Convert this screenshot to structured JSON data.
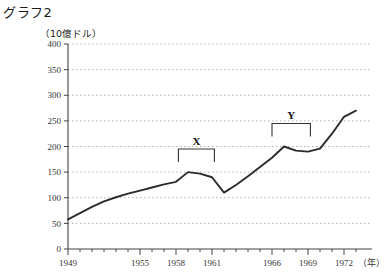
{
  "chart_title": "グラフ2",
  "unit_label": "（10億ドル）",
  "x_unit_label": "（年）",
  "annotations": {
    "x_bracket_label": "X",
    "y_bracket_label": "Y"
  },
  "colors": {
    "line": "#2b2b2b",
    "grid": "#b0b0b0",
    "axis": "#444444",
    "text": "#1a1a1a",
    "background": "#ffffff"
  },
  "chart_data": {
    "type": "line",
    "title": "グラフ2",
    "xlabel": "（年）",
    "ylabel": "（10億ドル）",
    "xlim": [
      1949,
      1973
    ],
    "ylim": [
      0,
      400
    ],
    "y_ticks": [
      0,
      50,
      100,
      150,
      200,
      250,
      300,
      350,
      400
    ],
    "x_ticks": [
      1949,
      1955,
      1958,
      1961,
      1966,
      1969,
      1972
    ],
    "x_tick_labels": [
      "1949",
      "1955",
      "1958",
      "1961",
      "1966",
      "1969",
      "1972"
    ],
    "grid": true,
    "grid_axis": "y",
    "legend": false,
    "series": [
      {
        "name": "value",
        "x": [
          1949,
          1950,
          1951,
          1952,
          1953,
          1954,
          1955,
          1956,
          1957,
          1958,
          1959,
          1960,
          1961,
          1962,
          1963,
          1964,
          1965,
          1966,
          1967,
          1968,
          1969,
          1970,
          1971,
          1972,
          1973
        ],
        "values": [
          58,
          70,
          82,
          93,
          101,
          108,
          114,
          120,
          126,
          131,
          150,
          147,
          140,
          110,
          125,
          142,
          160,
          178,
          200,
          192,
          190,
          196,
          225,
          258,
          270
        ]
      }
    ],
    "annotations": [
      {
        "label": "X",
        "type": "bracket",
        "x_start": 1958.2,
        "x_end": 1961.2,
        "y": 195
      },
      {
        "label": "Y",
        "type": "bracket",
        "x_start": 1966.0,
        "x_end": 1969.2,
        "y": 245
      }
    ]
  }
}
